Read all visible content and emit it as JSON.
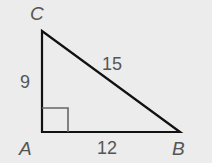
{
  "diagram": {
    "type": "right-triangle",
    "vertices": {
      "A": "A",
      "B": "B",
      "C": "C"
    },
    "sides": {
      "AC": "9",
      "AB": "12",
      "BC": "15"
    },
    "right_angle_at": "A",
    "colors": {
      "background": "#ececec",
      "stroke": "#111111",
      "label": "#555555",
      "marker": "#666666"
    }
  }
}
